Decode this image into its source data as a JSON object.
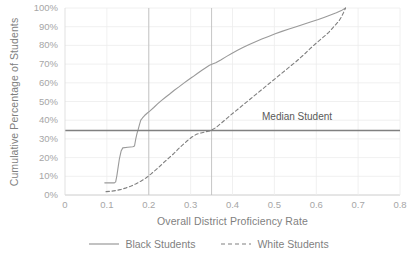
{
  "chart_data": {
    "type": "line",
    "title": "",
    "xlabel": "Overall District Proficiency Rate",
    "ylabel": "Cumulative Percentage of Students",
    "xlim": [
      0,
      0.8
    ],
    "ylim": [
      0,
      1.0
    ],
    "grid": true,
    "legend_position": "bottom",
    "xticks": [
      "0",
      "0.1",
      "0.2",
      "0.3",
      "0.4",
      "0.5",
      "0.6",
      "0.7",
      "0.8"
    ],
    "xtick_values": [
      0,
      0.1,
      0.2,
      0.3,
      0.4,
      0.5,
      0.6,
      0.7,
      0.8
    ],
    "yticks": [
      "0%",
      "10%",
      "20%",
      "30%",
      "40%",
      "50%",
      "60%",
      "70%",
      "80%",
      "90%",
      "100%"
    ],
    "ytick_values": [
      0,
      0.1,
      0.2,
      0.3,
      0.4,
      0.5,
      0.6,
      0.7,
      0.8,
      0.9,
      1.0
    ],
    "annotations": [
      {
        "name": "median-student",
        "label": "Median Student",
        "type": "hline",
        "y": 0.345,
        "color": "#808080"
      },
      {
        "name": "black-median-crossing",
        "type": "vline",
        "x": 0.2,
        "color": "#bfbfbf"
      },
      {
        "name": "white-median-crossing",
        "type": "vline",
        "x": 0.35,
        "color": "#bfbfbf"
      }
    ],
    "series": [
      {
        "name": "Black Students",
        "style": "solid",
        "color": "#9a9a9a",
        "points": [
          [
            0.095,
            0.065
          ],
          [
            0.118,
            0.065
          ],
          [
            0.121,
            0.07
          ],
          [
            0.124,
            0.105
          ],
          [
            0.127,
            0.15
          ],
          [
            0.13,
            0.195
          ],
          [
            0.134,
            0.235
          ],
          [
            0.138,
            0.252
          ],
          [
            0.15,
            0.255
          ],
          [
            0.162,
            0.258
          ],
          [
            0.166,
            0.262
          ],
          [
            0.169,
            0.3
          ],
          [
            0.172,
            0.33
          ],
          [
            0.175,
            0.352
          ],
          [
            0.178,
            0.378
          ],
          [
            0.181,
            0.4
          ],
          [
            0.185,
            0.412
          ],
          [
            0.19,
            0.425
          ],
          [
            0.196,
            0.437
          ],
          [
            0.203,
            0.45
          ],
          [
            0.212,
            0.468
          ],
          [
            0.221,
            0.487
          ],
          [
            0.23,
            0.505
          ],
          [
            0.24,
            0.523
          ],
          [
            0.25,
            0.54
          ],
          [
            0.261,
            0.56
          ],
          [
            0.272,
            0.578
          ],
          [
            0.283,
            0.597
          ],
          [
            0.294,
            0.615
          ],
          [
            0.305,
            0.632
          ],
          [
            0.316,
            0.65
          ],
          [
            0.327,
            0.667
          ],
          [
            0.337,
            0.682
          ],
          [
            0.345,
            0.694
          ],
          [
            0.352,
            0.7
          ],
          [
            0.36,
            0.707
          ],
          [
            0.372,
            0.722
          ],
          [
            0.385,
            0.74
          ],
          [
            0.398,
            0.757
          ],
          [
            0.412,
            0.774
          ],
          [
            0.426,
            0.79
          ],
          [
            0.44,
            0.805
          ],
          [
            0.455,
            0.82
          ],
          [
            0.47,
            0.834
          ],
          [
            0.486,
            0.848
          ],
          [
            0.502,
            0.862
          ],
          [
            0.518,
            0.875
          ],
          [
            0.535,
            0.888
          ],
          [
            0.552,
            0.9
          ],
          [
            0.57,
            0.913
          ],
          [
            0.588,
            0.926
          ],
          [
            0.605,
            0.938
          ],
          [
            0.62,
            0.95
          ],
          [
            0.634,
            0.962
          ],
          [
            0.648,
            0.974
          ],
          [
            0.66,
            0.986
          ],
          [
            0.67,
            1.0
          ]
        ]
      },
      {
        "name": "White Students",
        "style": "dashed",
        "color": "#808080",
        "points": [
          [
            0.098,
            0.018
          ],
          [
            0.11,
            0.02
          ],
          [
            0.122,
            0.024
          ],
          [
            0.134,
            0.03
          ],
          [
            0.146,
            0.038
          ],
          [
            0.158,
            0.048
          ],
          [
            0.17,
            0.06
          ],
          [
            0.182,
            0.075
          ],
          [
            0.194,
            0.092
          ],
          [
            0.205,
            0.112
          ],
          [
            0.216,
            0.133
          ],
          [
            0.227,
            0.155
          ],
          [
            0.238,
            0.178
          ],
          [
            0.249,
            0.2
          ],
          [
            0.26,
            0.222
          ],
          [
            0.27,
            0.245
          ],
          [
            0.281,
            0.268
          ],
          [
            0.292,
            0.29
          ],
          [
            0.303,
            0.31
          ],
          [
            0.314,
            0.325
          ],
          [
            0.325,
            0.332
          ],
          [
            0.336,
            0.338
          ],
          [
            0.348,
            0.344
          ],
          [
            0.36,
            0.36
          ],
          [
            0.372,
            0.382
          ],
          [
            0.384,
            0.405
          ],
          [
            0.396,
            0.428
          ],
          [
            0.408,
            0.45
          ],
          [
            0.42,
            0.472
          ],
          [
            0.432,
            0.494
          ],
          [
            0.444,
            0.516
          ],
          [
            0.456,
            0.538
          ],
          [
            0.468,
            0.56
          ],
          [
            0.48,
            0.582
          ],
          [
            0.492,
            0.604
          ],
          [
            0.504,
            0.626
          ],
          [
            0.516,
            0.648
          ],
          [
            0.528,
            0.67
          ],
          [
            0.54,
            0.692
          ],
          [
            0.552,
            0.714
          ],
          [
            0.563,
            0.736
          ],
          [
            0.574,
            0.758
          ],
          [
            0.584,
            0.78
          ],
          [
            0.594,
            0.8
          ],
          [
            0.603,
            0.818
          ],
          [
            0.612,
            0.835
          ],
          [
            0.621,
            0.852
          ],
          [
            0.63,
            0.87
          ],
          [
            0.638,
            0.89
          ],
          [
            0.646,
            0.91
          ],
          [
            0.654,
            0.93
          ],
          [
            0.66,
            0.952
          ],
          [
            0.665,
            0.975
          ],
          [
            0.67,
            1.0
          ]
        ]
      }
    ]
  }
}
